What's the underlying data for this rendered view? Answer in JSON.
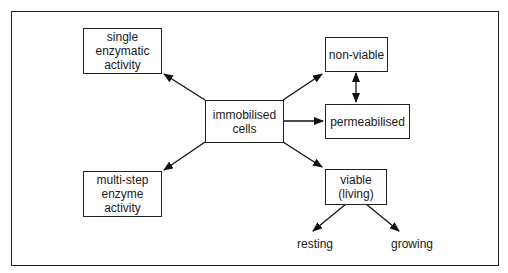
{
  "diagram": {
    "nodes": {
      "center": {
        "lines": [
          "immobilised",
          "cells"
        ]
      },
      "single": {
        "lines": [
          "single",
          "enzymatic",
          "activity"
        ]
      },
      "multi": {
        "lines": [
          "multi-step",
          "enzyme",
          "activity"
        ]
      },
      "nonviable": {
        "lines": [
          "non-viable"
        ]
      },
      "permeabilised": {
        "lines": [
          "permeabilised"
        ]
      },
      "viable": {
        "lines": [
          "viable",
          "(living)"
        ]
      },
      "resting": {
        "label": "resting"
      },
      "growing": {
        "label": "growing"
      }
    },
    "edges": [
      {
        "from": "immobilised cells",
        "to": "single enzymatic activity"
      },
      {
        "from": "immobilised cells",
        "to": "multi-step enzyme activity"
      },
      {
        "from": "immobilised cells",
        "to": "non-viable"
      },
      {
        "from": "immobilised cells",
        "to": "permeabilised"
      },
      {
        "from": "immobilised cells",
        "to": "viable (living)"
      },
      {
        "from": "non-viable",
        "to": "permeabilised",
        "bidirectional": true
      },
      {
        "from": "viable (living)",
        "to": "resting"
      },
      {
        "from": "viable (living)",
        "to": "growing"
      }
    ]
  }
}
